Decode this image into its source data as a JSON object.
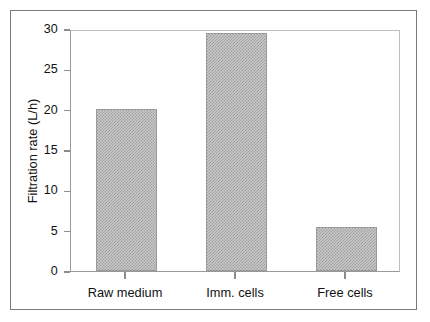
{
  "chart_data": {
    "type": "bar",
    "title": "",
    "subtitle": "",
    "xlabel": "",
    "ylabel": "Filtration rate (L/h)",
    "categories": [
      "Raw medium",
      "Imm. cells",
      "Free cells"
    ],
    "values": [
      20.1,
      29.5,
      5.5
    ],
    "ylim": [
      0,
      30
    ],
    "yticks": [
      0,
      5,
      10,
      15,
      20,
      25,
      30
    ],
    "ytick_labels": [
      "0",
      "5",
      "10",
      "15",
      "20",
      "25",
      "30"
    ],
    "xtick_labels": [
      "Raw medium",
      "Imm. cells",
      "Free cells"
    ],
    "grid": false,
    "legend": null,
    "legend_position": "none",
    "annotations": [],
    "series": [
      {
        "name": "Filtration rate",
        "values": [
          20.1,
          29.5,
          5.5
        ]
      }
    ],
    "style": {
      "bar_fill": "#c9c9c9",
      "bar_pattern": "fine-checkerboard-gray",
      "bar_edge": "#9a9a9a",
      "axis_color": "#8c8c8c",
      "text_color": "#111111",
      "frame_color": "#7a7a7a",
      "background": "#ffffff"
    }
  }
}
